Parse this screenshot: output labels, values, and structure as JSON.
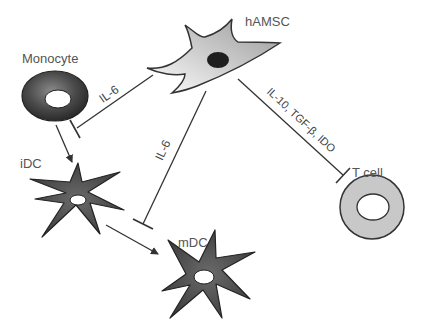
{
  "diagram": {
    "nodes": [
      {
        "id": "monocyte",
        "label": "Monocyte"
      },
      {
        "id": "hamsc",
        "label": "hAMSC"
      },
      {
        "id": "idc",
        "label": "iDC"
      },
      {
        "id": "mdc",
        "label": "mDC"
      },
      {
        "id": "tcell",
        "label": "T cell"
      }
    ],
    "edges": [
      {
        "from": "hamsc",
        "to": "monocyte",
        "type": "inhibit",
        "label": "IL-6"
      },
      {
        "from": "hamsc",
        "to": "mdc",
        "type": "inhibit",
        "label": "IL-6"
      },
      {
        "from": "hamsc",
        "to": "tcell",
        "type": "inhibit",
        "label": "IL-10, TGF-β, IDO"
      },
      {
        "from": "monocyte",
        "to": "idc",
        "type": "activate",
        "label": ""
      },
      {
        "from": "idc",
        "to": "mdc",
        "type": "activate",
        "label": ""
      }
    ]
  },
  "labels": {
    "monocyte": "Monocyte",
    "hamsc": "hAMSC",
    "idc": "iDC",
    "mdc": "mDC",
    "tcell": "T cell",
    "edge_monocyte": "IL-6",
    "edge_mdc": "IL-6",
    "edge_tcell": "IL-10, TGF-β, IDO"
  },
  "colors": {
    "line": "#333333",
    "dc_fill": "#4a4a4a",
    "tcell_fill": "#c8c8c8",
    "hamsc_fill": "#bdbdbd"
  }
}
